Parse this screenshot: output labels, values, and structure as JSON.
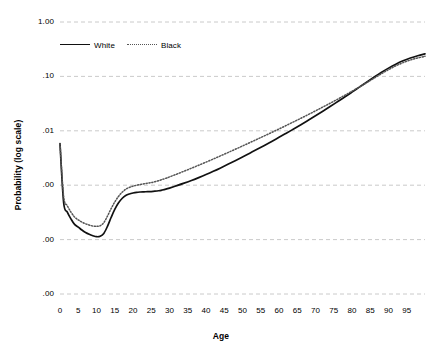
{
  "chart_data": {
    "type": "line",
    "title": "",
    "xlabel": "Age",
    "ylabel": "Probability (log scale)",
    "y_scale": "log",
    "grid": true,
    "legend_position": "top-left-inside",
    "xlim": [
      0,
      100
    ],
    "ylim": [
      1e-05,
      1.0
    ],
    "y_ticks": [
      1.0,
      0.1,
      0.01,
      0.001,
      0.0001,
      1e-05
    ],
    "y_tick_labels": [
      "1.00",
      ".10",
      ".01",
      ".00",
      ".00",
      ".00"
    ],
    "x_ticks": [
      0,
      5,
      10,
      15,
      20,
      25,
      30,
      35,
      40,
      45,
      50,
      55,
      60,
      65,
      70,
      75,
      80,
      85,
      90,
      95
    ],
    "x_tick_labels": [
      "0",
      "5",
      "10",
      "15",
      "20",
      "25",
      "30",
      "35",
      "40",
      "45",
      "50",
      "55",
      "60",
      "65",
      "70",
      "75",
      "80",
      "85",
      "90",
      "95"
    ],
    "x": [
      0,
      1,
      2,
      3,
      4,
      5,
      6,
      7,
      8,
      9,
      10,
      11,
      12,
      13,
      14,
      15,
      16,
      17,
      18,
      19,
      20,
      21,
      22,
      23,
      24,
      25,
      26,
      27,
      28,
      29,
      30,
      32,
      34,
      36,
      38,
      40,
      42,
      44,
      46,
      48,
      50,
      52,
      54,
      56,
      58,
      60,
      62,
      64,
      66,
      68,
      70,
      72,
      74,
      76,
      78,
      80,
      82,
      84,
      86,
      88,
      90,
      92,
      94,
      96,
      98,
      100
    ],
    "series": [
      {
        "name": "White",
        "style": "solid",
        "color": "#111111",
        "values": [
          0.0058,
          0.00048,
          0.00032,
          0.00024,
          0.00019,
          0.00017,
          0.00015,
          0.000135,
          0.000125,
          0.000118,
          0.000113,
          0.000115,
          0.00013,
          0.000175,
          0.000255,
          0.00036,
          0.00047,
          0.00057,
          0.000645,
          0.00069,
          0.00072,
          0.00074,
          0.00075,
          0.000755,
          0.00076,
          0.000765,
          0.000775,
          0.00079,
          0.000815,
          0.000845,
          0.000885,
          0.00098,
          0.00109,
          0.00122,
          0.00138,
          0.00157,
          0.0018,
          0.00208,
          0.00242,
          0.00282,
          0.0033,
          0.00388,
          0.00456,
          0.00538,
          0.00638,
          0.00758,
          0.00903,
          0.0108,
          0.01295,
          0.0156,
          0.01885,
          0.0229,
          0.0279,
          0.0341,
          0.0418,
          0.0514,
          0.0634,
          0.0783,
          0.0965,
          0.118,
          0.142,
          0.168,
          0.194,
          0.218,
          0.24,
          0.26
        ]
      },
      {
        "name": "Black",
        "style": "dotted",
        "color": "#555555",
        "values": [
          0.0058,
          0.00062,
          0.00042,
          0.00032,
          0.00026,
          0.00023,
          0.00021,
          0.000195,
          0.000185,
          0.000178,
          0.000175,
          0.00018,
          0.000205,
          0.00027,
          0.00037,
          0.00049,
          0.00062,
          0.00074,
          0.00084,
          0.00091,
          0.00096,
          0.001,
          0.00103,
          0.00106,
          0.00109,
          0.00112,
          0.00116,
          0.00121,
          0.00127,
          0.00134,
          0.00142,
          0.0016,
          0.00181,
          0.00205,
          0.00233,
          0.00265,
          0.00303,
          0.00347,
          0.00398,
          0.00457,
          0.00526,
          0.00606,
          0.00699,
          0.00807,
          0.00933,
          0.0108,
          0.01255,
          0.0146,
          0.017,
          0.01985,
          0.02325,
          0.0273,
          0.0321,
          0.0379,
          0.0449,
          0.0534,
          0.0638,
          0.0766,
          0.0925,
          0.1115,
          0.133,
          0.156,
          0.179,
          0.2,
          0.218,
          0.234
        ]
      }
    ]
  },
  "legend": {
    "entries": [
      {
        "label": "White",
        "style": "solid"
      },
      {
        "label": "Black",
        "style": "dotted"
      }
    ]
  }
}
